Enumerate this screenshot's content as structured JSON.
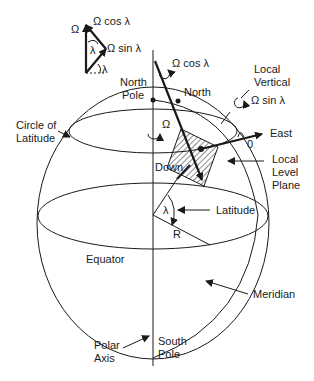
{
  "vector_triangle": {
    "omega": "Ω",
    "omega_cos": "Ω cos λ",
    "omega_sin": "Ω sin λ",
    "lambda1": "λ",
    "lambda2": "λ"
  },
  "labels": {
    "north_pole_1": "North",
    "north_pole_2": "Pole",
    "circle_of_latitude_1": "Circle of",
    "circle_of_latitude_2": "Latitude",
    "omega_axis": "Ω",
    "omega_cos_axis": "Ω cos λ",
    "north": "North",
    "local_vertical_1": "Local",
    "local_vertical_2": "Vertical",
    "omega_sin_vertical": "Ω sin λ",
    "east": "East",
    "zero": "0",
    "down": "Down",
    "local_level_plane_1": "Local",
    "local_level_plane_2": "Level",
    "local_level_plane_3": "Plane",
    "lambda_center": "λ",
    "latitude": "Latitude",
    "radius": "R",
    "equator": "Equator",
    "meridian": "Meridian",
    "polar_axis_1": "Polar",
    "polar_axis_2": "Axis",
    "south_pole_1": "South",
    "south_pole_2": "Pole"
  }
}
